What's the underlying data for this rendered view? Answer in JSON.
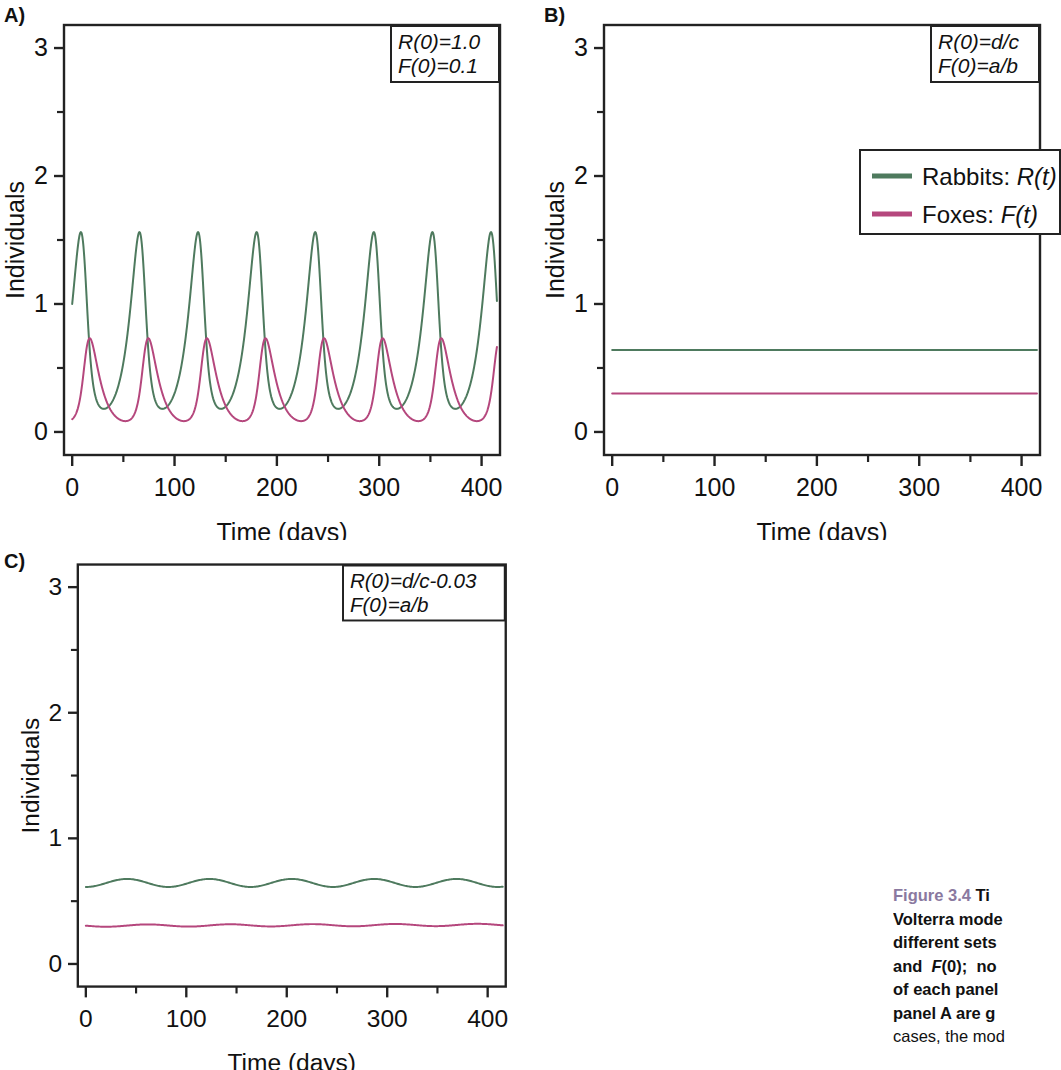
{
  "figure": {
    "caption_number": "Figure 3.4",
    "caption_lead": " Time courses of the Lotka-Volterra model for three different sets of initial values R(0) and F(0); noted in the top right of each panel. Parameters for panel A are given in the text. In all",
    "caption_rest": " cases, the mod",
    "caption_lines": [
      {
        "num": "Figure 3.4",
        "bold": " Ti",
        "rest": ""
      },
      {
        "num": "",
        "bold": "Volterra mode",
        "rest": ""
      },
      {
        "num": "",
        "bold": "different sets ",
        "rest": ""
      },
      {
        "num": "",
        "bold": "and  F(0);  no",
        "rest": ""
      },
      {
        "num": "",
        "bold": "of each panel",
        "rest": ""
      },
      {
        "num": "",
        "bold": "panel A are g",
        "rest": ""
      },
      {
        "num": "",
        "bold": "",
        "rest": "cases, the mod"
      }
    ],
    "number_color": "#8a79a0"
  },
  "colors": {
    "rabbits": "#4e7a5e",
    "foxes": "#b5477d",
    "axis": "#222222",
    "text": "#111111"
  },
  "legend": {
    "items": [
      {
        "label": "Rabbits: ",
        "symbol": "R(t)",
        "color_key": "rabbits"
      },
      {
        "label": "Foxes: ",
        "symbol": "F(t)",
        "color_key": "foxes"
      }
    ]
  },
  "panels": [
    {
      "letter": "A)",
      "annotation": [
        "R(0)=1.0",
        "F(0)=0.1"
      ],
      "xlabel": "Time (days)",
      "ylabel": "Individuals",
      "xticks": [
        0,
        100,
        200,
        300,
        400
      ],
      "yticks": [
        0,
        1,
        2,
        3
      ],
      "xminor": [
        50,
        150,
        250,
        350
      ],
      "yminor": [
        0.5,
        1.5,
        2.5
      ],
      "xlim": [
        -8,
        418
      ],
      "ylim": [
        -0.18,
        3.18
      ],
      "has_legend": false
    },
    {
      "letter": "B)",
      "annotation": [
        "R(0)=d/c",
        "F(0)=a/b"
      ],
      "xlabel": "Time (days)",
      "ylabel": "Individuals",
      "xticks": [
        0,
        100,
        200,
        300,
        400
      ],
      "yticks": [
        0,
        1,
        2,
        3
      ],
      "xminor": [
        50,
        150,
        250,
        350
      ],
      "yminor": [
        0.5,
        1.5,
        2.5
      ],
      "xlim": [
        -8,
        418
      ],
      "ylim": [
        -0.18,
        3.18
      ],
      "has_legend": true
    },
    {
      "letter": "C)",
      "annotation": [
        "R(0)=d/c-0.03",
        "F(0)=a/b"
      ],
      "xlabel": "Time (days)",
      "ylabel": "Individuals",
      "xticks": [
        0,
        100,
        200,
        300,
        400
      ],
      "yticks": [
        0,
        1,
        2,
        3
      ],
      "xminor": [
        50,
        150,
        250,
        350
      ],
      "yminor": [
        0.5,
        1.5,
        2.5
      ],
      "xlim": [
        -8,
        418
      ],
      "ylim": [
        -0.18,
        3.18
      ],
      "has_legend": false
    }
  ],
  "chart_data": [
    {
      "type": "line",
      "panel": "A",
      "title": "Lotka-Volterra time course, R(0)=1.0, F(0)=0.1",
      "xlabel": "Time (days)",
      "ylabel": "Individuals",
      "xlim": [
        0,
        415
      ],
      "ylim": [
        0,
        3
      ],
      "grid": false,
      "legend_position": "none",
      "annotation": [
        "R(0)=1.0",
        "F(0)=0.1"
      ],
      "model": {
        "kind": "lotka-volterra-limit-cycle",
        "period_days": 96,
        "rabbits": {
          "initial": 1.0,
          "peak": 2.68,
          "trough": 0.07,
          "peak_time_first": 13
        },
        "foxes": {
          "initial": 0.1,
          "peak": 0.72,
          "trough": 0.1,
          "peak_time_first": 27
        }
      },
      "series": [
        {
          "name": "Rabbits: R(t)",
          "color": "#4e7a5e",
          "peaks_x": [
            13,
            109,
            205,
            301,
            397
          ],
          "peak_value": 2.68,
          "trough_value": 0.07
        },
        {
          "name": "Foxes: F(t)",
          "color": "#b5477d",
          "peaks_x": [
            27,
            123,
            219,
            315,
            411
          ],
          "peak_value": 0.72,
          "trough_value": 0.1
        }
      ]
    },
    {
      "type": "line",
      "panel": "B",
      "title": "Lotka-Volterra time course at equilibrium, R(0)=d/c, F(0)=a/b",
      "xlabel": "Time (days)",
      "ylabel": "Individuals",
      "xlim": [
        0,
        415
      ],
      "ylim": [
        0,
        3
      ],
      "grid": false,
      "legend_position": "upper-right-inset",
      "annotation": [
        "R(0)=d/c",
        "F(0)=a/b"
      ],
      "series": [
        {
          "name": "Rabbits: R(t)",
          "color": "#4e7a5e",
          "constant_value": 0.64
        },
        {
          "name": "Foxes: F(t)",
          "color": "#b5477d",
          "constant_value": 0.3
        }
      ]
    },
    {
      "type": "line",
      "panel": "C",
      "title": "Lotka-Volterra time course near equilibrium, R(0)=d/c-0.03, F(0)=a/b",
      "xlabel": "Time (days)",
      "ylabel": "Individuals",
      "xlim": [
        0,
        415
      ],
      "ylim": [
        0,
        3
      ],
      "grid": false,
      "legend_position": "none",
      "annotation": [
        "R(0)=d/c-0.03",
        "F(0)=a/b"
      ],
      "model": {
        "kind": "lotka-volterra-small-oscillation",
        "period_days": 82,
        "rabbits": {
          "mean": 0.645,
          "amplitude": 0.032,
          "initial": 0.615
        },
        "foxes": {
          "mean": 0.305,
          "amplitude": 0.009,
          "initial": 0.298
        }
      },
      "series": [
        {
          "name": "Rabbits: R(t)",
          "color": "#4e7a5e",
          "mean": 0.645,
          "amplitude": 0.032,
          "cycles": 5
        },
        {
          "name": "Foxes: F(t)",
          "color": "#b5477d",
          "mean": 0.305,
          "amplitude": 0.009,
          "cycles": 5
        }
      ]
    }
  ]
}
